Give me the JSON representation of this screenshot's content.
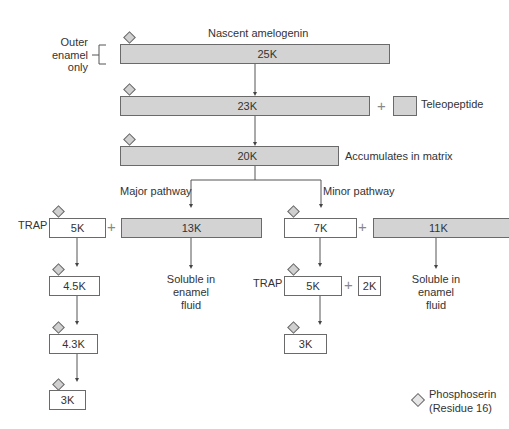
{
  "title": "Nascent amelogenin",
  "outer_enamel_label": [
    "Outer",
    "enamel",
    "only"
  ],
  "nodes": {
    "n25k": {
      "label": "25K"
    },
    "n23k": {
      "label": "23K"
    },
    "teleopeptide": {
      "label": "",
      "caption": "Teleopeptide"
    },
    "n20k": {
      "label": "20K",
      "caption": "Accumulates in matrix"
    },
    "major_5k": {
      "label": "5K",
      "prefix": "TRAP"
    },
    "n13k": {
      "label": "13K"
    },
    "n4_5k": {
      "label": "4.5K"
    },
    "n4_3k": {
      "label": "4.3K"
    },
    "major_3k": {
      "label": "3K"
    },
    "n7k": {
      "label": "7K"
    },
    "n11k": {
      "label": "11K"
    },
    "minor_5k": {
      "label": "5K",
      "prefix": "TRAP"
    },
    "n2k": {
      "label": "2K"
    },
    "minor_3k": {
      "label": "3K"
    }
  },
  "pathways": {
    "major": "Major pathway",
    "minor": "Minor pathway"
  },
  "soluble_text": [
    "Soluble in",
    "enamel",
    "fluid"
  ],
  "plus_symbol": "+",
  "legend": {
    "icon": "diamond-icon",
    "lines": [
      "Phosphoserin",
      "(Residue 16)"
    ]
  },
  "colors": {
    "gray_fill": "#d3d3d3",
    "border": "#6a6a6a",
    "text": "#333333"
  }
}
